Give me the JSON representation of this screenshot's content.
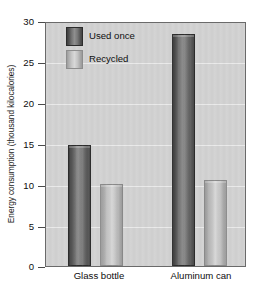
{
  "chart_data": {
    "type": "bar",
    "title": "",
    "xlabel": "",
    "ylabel": "Energy consumption (thousand kilocalories)",
    "categories": [
      "Glass bottle",
      "Aluminum can"
    ],
    "series": [
      {
        "name": "Used once",
        "values": [
          14.8,
          28.4
        ],
        "color": "#5d5d5d"
      },
      {
        "name": "Recycled",
        "values": [
          10.0,
          10.5
        ],
        "color": "#c2c2c2"
      }
    ],
    "ylim": [
      0,
      30
    ],
    "yticks": [
      0,
      5,
      10,
      15,
      20,
      25,
      30
    ],
    "ytick_labels": [
      "0",
      "5",
      "10",
      "15",
      "20",
      "25",
      "30"
    ],
    "grid": true,
    "legend_position": "top-left",
    "plot_background": "#d2d2d2"
  },
  "legend": {
    "entries": [
      {
        "label": "Used once"
      },
      {
        "label": "Recycled"
      }
    ]
  }
}
